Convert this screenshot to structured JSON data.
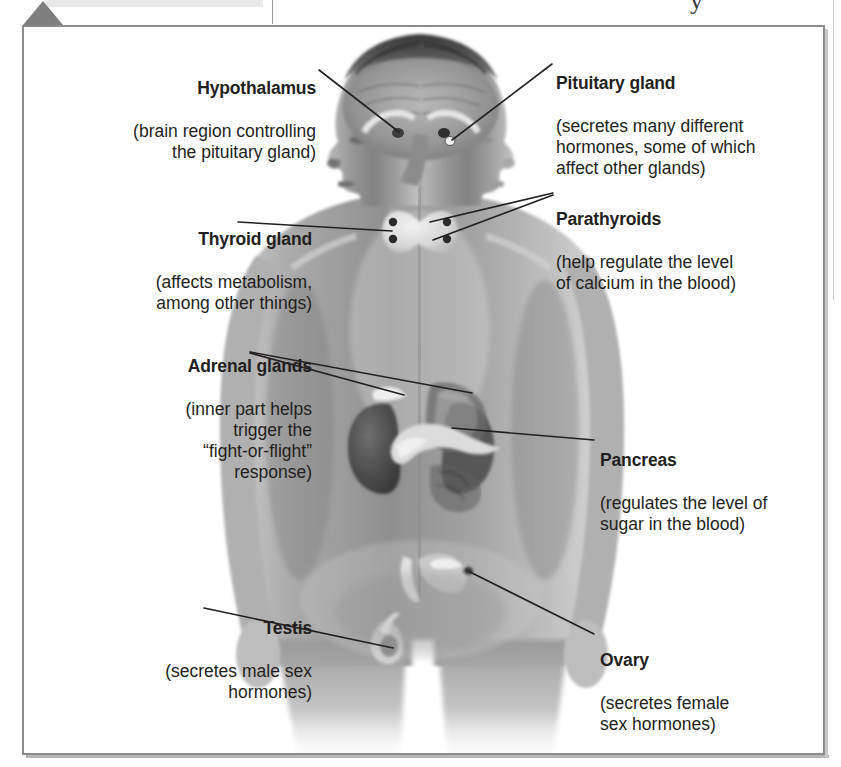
{
  "figure": {
    "kind": "anatomical-diagram",
    "frame_border_color": "#8c8c8c",
    "text_color": "#231f20",
    "background_color": "#ffffff"
  },
  "page": {
    "section_marker_icon": "triangle-marker-icon",
    "section_marker_color": "#7f7f7f",
    "top_rule_color": "#e8e8e8",
    "cropped_glyph": "y"
  },
  "labels": {
    "hypothalamus": {
      "title": "Hypothalamus",
      "desc": "(brain region controlling\nthe pituitary gland)",
      "align": "right"
    },
    "pituitary": {
      "title": "Pituitary gland",
      "desc": "(secretes many different\nhormones, some of which\naffect other glands)",
      "align": "left"
    },
    "parathyroids": {
      "title": "Parathyroids",
      "desc": "(help regulate the level\nof calcium in the blood)",
      "align": "left"
    },
    "thyroid": {
      "title": "Thyroid gland",
      "desc": "(affects metabolism,\namong other things)",
      "align": "right"
    },
    "adrenal": {
      "title": "Adrenal glands",
      "desc": "(inner part helps\ntrigger the\n“fight-or-flight”\nresponse)",
      "align": "right"
    },
    "pancreas": {
      "title": "Pancreas",
      "desc": "(regulates the level of\nsugar in the blood)",
      "align": "left"
    },
    "testis": {
      "title": "Testis",
      "desc": "(secretes male sex\nhormones)",
      "align": "right"
    },
    "ovary": {
      "title": "Ovary",
      "desc": "(secretes female\nsex hormones)",
      "align": "left"
    }
  }
}
